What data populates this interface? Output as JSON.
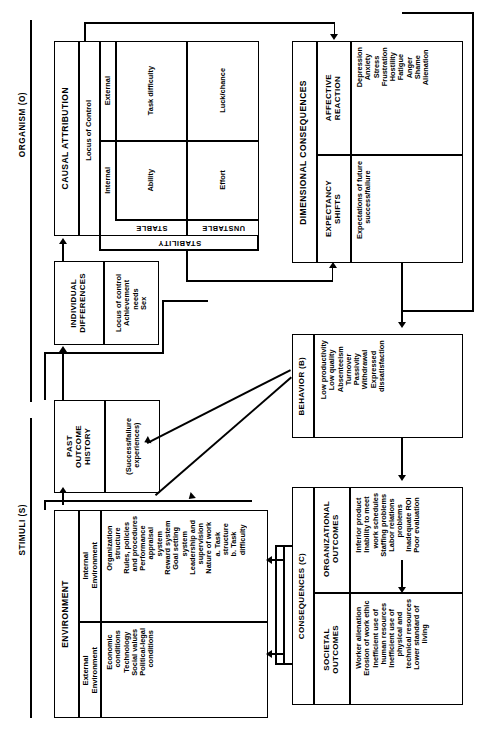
{
  "figure": {
    "orientation": "rotated-90-ccw",
    "domain_labels": {
      "stimuli": "STIMULI (S)",
      "organism": "ORGANISM (O)"
    }
  },
  "environment": {
    "title": "ENVIRONMENT",
    "external": {
      "label": "External\nEnvironment",
      "items": "Economic\n   conditions\nTechnology\nSocial values\nPolitical-legal\n   conditions"
    },
    "internal": {
      "label": "Internal\nEnvironment",
      "items": "Organization\n    structure\nRules, policies\n    and procedures\nPerformance\n    appraisal\n    system\nReward system\nGoal setting\n    system\nLeadership and\n    supervision\nNature of work\n    a. Task\n        structure\n    b. Task\n        difficulty"
    }
  },
  "past_outcome_history": {
    "title": "PAST\nOUTCOME\nHISTORY",
    "items": "(Success/failure\n experiences)"
  },
  "individual_differences": {
    "title": "INDIVIDUAL\nDIFFERENCES",
    "items": "Locus of control\nAchievement\n    needs\nSex"
  },
  "causal_attribution": {
    "title": "CAUSAL ATTRIBUTION",
    "row_axis_label": "Locus of Control",
    "row_headers": [
      "Internal",
      "External"
    ],
    "col_axis_label": "STABILITY",
    "col_headers": [
      "STABLE",
      "UNSTABLE"
    ],
    "cells": {
      "internal_stable": "Ability",
      "internal_unstable": "Effort",
      "external_stable": "Task difficulty",
      "external_unstable": "Luck/chance"
    }
  },
  "dimensional_consequences": {
    "title": "DIMENSIONAL CONSEQUENCES",
    "expectancy": {
      "label": "EXPECTANCY\nSHIFTS",
      "items": "Expectations of future\n   success/failure"
    },
    "affective": {
      "label": "AFFECTIVE\nREACTION",
      "items": "Depression\nAnxiety\nStress\nFrustration\nHostility\nFatigue\nAnger\nShame\nAlienation"
    }
  },
  "behavior": {
    "title": "BEHAVIOR (B)",
    "items": "Low productivity\nLow quality\nAbsenteeism\nTurnover\nPassivity\nWithdrawal\nExpressed\n   dissatisfaction"
  },
  "consequences": {
    "title": "CONSEQUENCES (C)",
    "societal": {
      "label": "SOCIETAL\nOUTCOMES",
      "items": "Worker alienation\nErosion of work ethic\nInefficient use of\n    human resources\nInefficient use of\n    physical and\n    technical resources\nLower standard of\n    living"
    },
    "organizational": {
      "label": "ORGANIZATIONAL\nOUTCOMES",
      "items": "Inferior product\nInability to meet\n    work schedules\nStaffing problems\nLabor relations\n    problems\nInadequate ROI\nPoor evaluation"
    }
  },
  "colors": {
    "ink": "#000000",
    "paper": "#ffffff"
  }
}
